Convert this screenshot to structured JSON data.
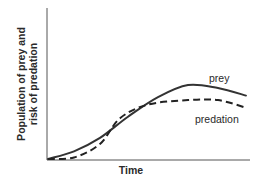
{
  "chart_data": {
    "type": "line",
    "title": "",
    "xlabel": "Time",
    "ylabel_lines": [
      "Population of prey and",
      "risk of predation"
    ],
    "ylabel": "Population of prey and risk of predation",
    "x_ticks": [],
    "y_ticks": [],
    "grid": false,
    "legend": "inline annotations",
    "xlim": [
      0,
      100
    ],
    "ylim": [
      0,
      100
    ],
    "series": [
      {
        "name": "prey",
        "style": "solid",
        "color": "#333333",
        "x": [
          0,
          13,
          26,
          40,
          55,
          70,
          85,
          99
        ],
        "y": [
          0,
          5,
          14,
          28,
          41,
          49,
          47,
          42
        ]
      },
      {
        "name": "predation",
        "style": "dashed",
        "color": "#222222",
        "x": [
          0,
          13,
          26,
          36,
          50,
          70,
          85,
          99
        ],
        "y": [
          0,
          1,
          10,
          27,
          36,
          39,
          39,
          34
        ]
      }
    ],
    "annotations": [
      {
        "text": "prey",
        "near_series": "prey"
      },
      {
        "text": "predation",
        "near_series": "predation"
      }
    ]
  },
  "labels": {
    "x_axis": "Time",
    "y_axis_line1": "Population of prey and",
    "y_axis_line2": "risk of predation",
    "prey": "prey",
    "predation": "predation"
  }
}
